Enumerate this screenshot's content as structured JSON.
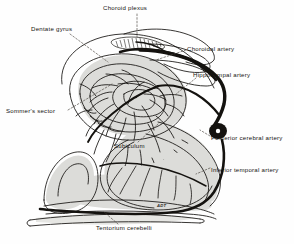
{
  "figure": {
    "type": "anatomical-line-drawing",
    "background_color": "#fefefe",
    "ink_color": "#14120f",
    "shade_color": "#d9d9d6",
    "signature": "ADT"
  },
  "labels": [
    {
      "id": "choroid-plexus",
      "text": "Choroid plexus",
      "x": 103,
      "y": 5,
      "anchor": "start"
    },
    {
      "id": "dentate-gyrus",
      "text": "Dentate gyrus",
      "x": 31,
      "y": 26,
      "anchor": "start"
    },
    {
      "id": "choroidal-artery",
      "text": "Choroidal artery",
      "x": 187,
      "y": 46,
      "anchor": "start"
    },
    {
      "id": "hippocampal-artery",
      "text": "Hippocampal artery",
      "x": 193,
      "y": 72,
      "anchor": "start"
    },
    {
      "id": "sommers-sector",
      "text": "Sommer's sector",
      "x": 6,
      "y": 108,
      "anchor": "start"
    },
    {
      "id": "posterior-cerebral-artery",
      "text": "Posterior cerebral artery",
      "x": 211,
      "y": 135,
      "anchor": "start"
    },
    {
      "id": "subiculum",
      "text": "Subiculum",
      "x": 114,
      "y": 143,
      "anchor": "start"
    },
    {
      "id": "inferior-temporal-artery",
      "text": "Inferior temporal artery",
      "x": 211,
      "y": 167,
      "anchor": "start"
    },
    {
      "id": "tentorium-cerebelli",
      "text": "Tentorium cerebelli",
      "x": 96,
      "y": 225,
      "anchor": "start"
    }
  ],
  "structures": [
    {
      "id": "hippocampus-body",
      "name": "hippocampus"
    },
    {
      "id": "dentate-gyrus-band",
      "name": "dentate gyrus"
    },
    {
      "id": "choroid-plexus-tuft",
      "name": "choroid plexus"
    },
    {
      "id": "subiculum-region",
      "name": "subiculum"
    },
    {
      "id": "tentorium-band",
      "name": "tentorium cerebelli"
    },
    {
      "id": "parahippocampal",
      "name": "parahippocampal gyrus"
    }
  ],
  "arteries": [
    {
      "id": "posterior-cerebral",
      "name": "Posterior cerebral artery"
    },
    {
      "id": "choroidal",
      "name": "Choroidal artery"
    },
    {
      "id": "hippocampal",
      "name": "Hippocampal artery"
    },
    {
      "id": "inferior-temporal",
      "name": "Inferior temporal artery"
    }
  ]
}
